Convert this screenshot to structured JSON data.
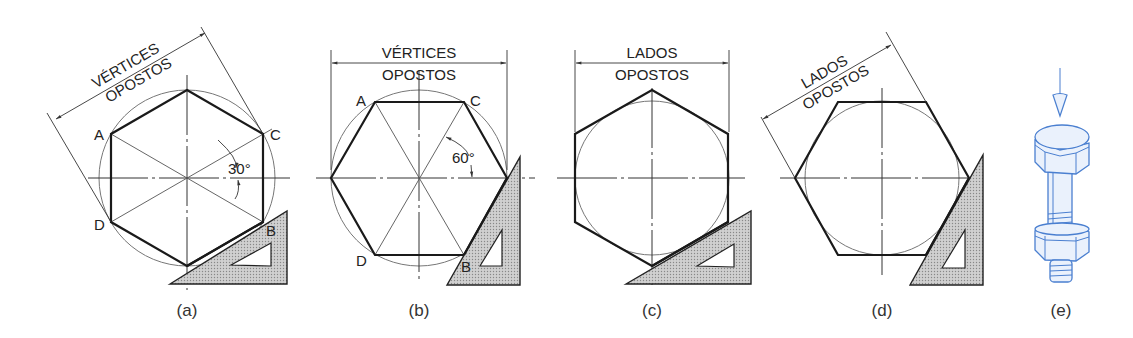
{
  "figure": {
    "panels": [
      {
        "id": "a",
        "caption": "(a)",
        "dimension_line1": "VÉRTICES",
        "dimension_line2": "OPOSTOS",
        "vertex_labels": [
          "A",
          "C",
          "D",
          "B"
        ],
        "angle_label": "30°"
      },
      {
        "id": "b",
        "caption": "(b)",
        "dimension_line1": "VÉRTICES",
        "dimension_line2": "OPOSTOS",
        "vertex_labels": [
          "A",
          "C",
          "D",
          "B"
        ],
        "angle_label": "60°"
      },
      {
        "id": "c",
        "caption": "(c)",
        "dimension_line1": "LADOS",
        "dimension_line2": "OPOSTOS"
      },
      {
        "id": "d",
        "caption": "(d)",
        "dimension_line1": "LADOS",
        "dimension_line2": "OPOSTOS"
      },
      {
        "id": "e",
        "caption": "(e)",
        "illustration": "hex-bolt-with-nut"
      }
    ],
    "colors": {
      "line": "#1a1a1a",
      "triangle_fill": "#bdbdbd",
      "bolt_blue": "#4a7fd0"
    }
  }
}
